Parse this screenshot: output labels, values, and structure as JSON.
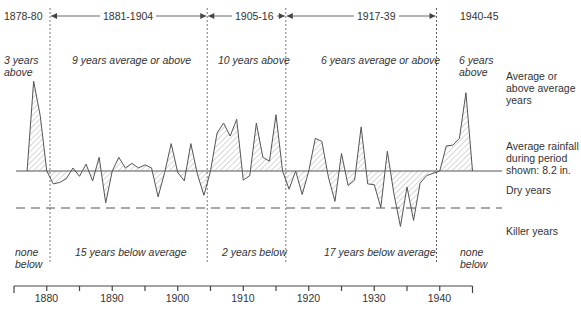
{
  "chart_data": {
    "type": "area",
    "title": "",
    "xlabel": "",
    "ylabel": "",
    "average_rainfall_in": 8.2,
    "killer_threshold_in": 5.0,
    "x_ticks": [
      1880,
      1890,
      1900,
      1910,
      1920,
      1930,
      1940
    ],
    "xlim": [
      1875,
      1945
    ],
    "periods": [
      {
        "label": "1878-80",
        "start": 1878,
        "end": 1880,
        "above": "3 years above",
        "below": "none below"
      },
      {
        "label": "1881-1904",
        "start": 1881,
        "end": 1904,
        "above": "9 years average or above",
        "below": "15 years below average"
      },
      {
        "label": "1905-16",
        "start": 1905,
        "end": 1916,
        "above": "10 years above",
        "below": "2 years below"
      },
      {
        "label": "1917-39",
        "start": 1917,
        "end": 1939,
        "above": "6 years average or above",
        "below": "17 years below average"
      },
      {
        "label": "1940-45",
        "start": 1940,
        "end": 1945,
        "above": "6 years above",
        "below": "none below"
      }
    ],
    "legend_right": [
      "Average or above average years",
      "Average rainfall during period shown: 8.2 in.",
      "Dry years",
      "Killer years"
    ],
    "x": [
      1877,
      1878,
      1879,
      1880,
      1881,
      1882,
      1883,
      1884,
      1885,
      1886,
      1887,
      1888,
      1889,
      1890,
      1891,
      1892,
      1893,
      1894,
      1895,
      1896,
      1897,
      1898,
      1899,
      1900,
      1901,
      1902,
      1903,
      1904,
      1905,
      1906,
      1907,
      1908,
      1909,
      1910,
      1911,
      1912,
      1913,
      1914,
      1915,
      1916,
      1917,
      1918,
      1919,
      1920,
      1921,
      1922,
      1923,
      1924,
      1925,
      1926,
      1927,
      1928,
      1929,
      1930,
      1931,
      1932,
      1933,
      1934,
      1935,
      1936,
      1937,
      1938,
      1939,
      1940,
      1941,
      1942,
      1943,
      1944,
      1945
    ],
    "values": [
      8.2,
      20.0,
      15.5,
      8.2,
      6.5,
      6.7,
      7.2,
      8.6,
      7.5,
      9.1,
      6.9,
      10.0,
      4.0,
      8.2,
      10.0,
      8.6,
      9.2,
      8.6,
      9.0,
      8.6,
      4.8,
      8.0,
      11.8,
      8.0,
      6.9,
      11.8,
      7.8,
      5.0,
      8.2,
      13.2,
      14.5,
      12.8,
      15.0,
      7.0,
      7.6,
      14.5,
      10.0,
      9.5,
      15.6,
      8.2,
      5.8,
      8.2,
      5.1,
      8.2,
      12.5,
      12.1,
      7.4,
      4.2,
      10.5,
      6.3,
      7.0,
      14.0,
      6.5,
      6.4,
      3.4,
      10.8,
      5.2,
      0.9,
      6.1,
      1.7,
      6.6,
      7.6,
      7.9,
      8.2,
      11.5,
      11.6,
      12.5,
      18.5,
      8.2
    ]
  },
  "layout": {
    "x0_year": 1875,
    "x0_px": 14,
    "px_per_year": 6.55,
    "avg_y_px": 171,
    "px_per_inch": 7.6,
    "killer_y_px": 208,
    "plot_left_px": 14,
    "plot_right_px": 480,
    "axis_y_px": 286,
    "divider_years": [
      1880.5,
      1904.5,
      1916.5,
      1939.5
    ]
  },
  "colors": {
    "line": "#555555",
    "hatch": "#888888",
    "text": "#333333",
    "axis": "#444444"
  }
}
